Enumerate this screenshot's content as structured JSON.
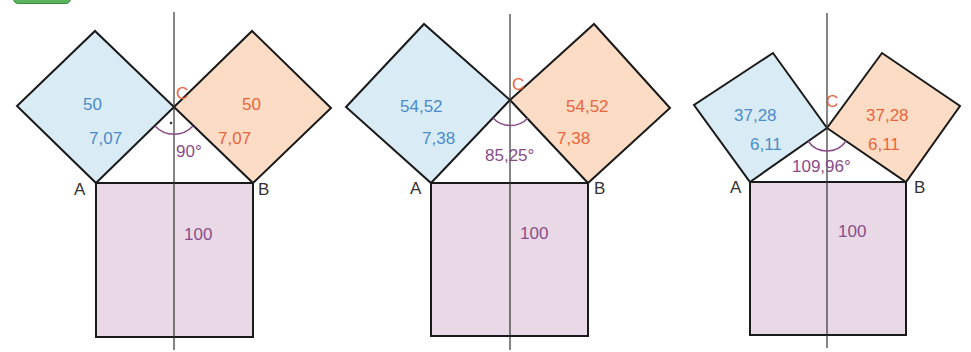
{
  "badge": {
    "color": "#5bb35e"
  },
  "colors": {
    "blue_fill": "#d9ecf6",
    "blue_text": "#4c8bc9",
    "orange_fill": "#fcdcc4",
    "orange_text": "#e8663c",
    "purple_fill": "#e9d9e7",
    "purple_text": "#8a4c88",
    "vertex_c": "#e8663c",
    "stroke": "#1a1a1a"
  },
  "figures": [
    {
      "id": "fig1",
      "vertex_a": "A",
      "vertex_b": "B",
      "vertex_c": "C",
      "left_area": "50",
      "left_side": "7,07",
      "right_area": "50",
      "right_side": "7,07",
      "bottom_area": "100",
      "angle": "90°",
      "right_angle_marker": true
    },
    {
      "id": "fig2",
      "vertex_a": "A",
      "vertex_b": "B",
      "vertex_c": "C",
      "left_area": "54,52",
      "left_side": "7,38",
      "right_area": "54,52",
      "right_side": "7,38",
      "bottom_area": "100",
      "angle": "85,25°",
      "right_angle_marker": false
    },
    {
      "id": "fig3",
      "vertex_a": "A",
      "vertex_b": "B",
      "vertex_c": "C",
      "left_area": "37,28",
      "left_side": "6,11",
      "right_area": "37,28",
      "right_side": "6,11",
      "bottom_area": "100",
      "angle": "109,96°",
      "right_angle_marker": false
    }
  ]
}
